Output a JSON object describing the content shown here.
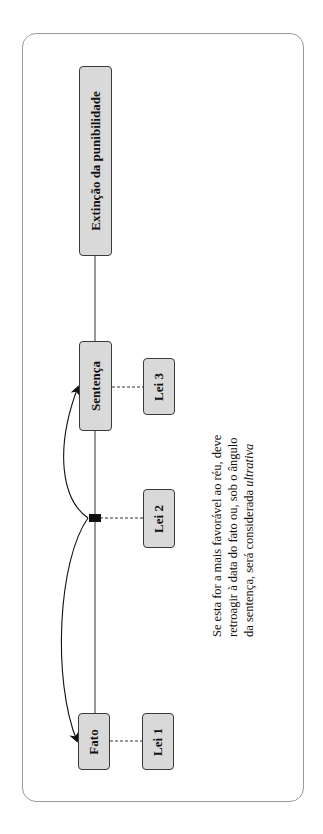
{
  "diagram": {
    "nodes": {
      "extincao": "Extinção da punibilidade",
      "sentenca": "Sentença",
      "fato": "Fato",
      "lei1": "Lei 1",
      "lei2": "Lei 2",
      "lei3": "Lei 3"
    },
    "note": {
      "text": "Se esta for a mais favorável ao réu, deve retroagir à data do fato ou, sob o ângulo da sentença, será considerada",
      "emphasis": "ultrativa"
    },
    "edges": [
      {
        "from": "Fato",
        "to": "Sentença",
        "style": "solid"
      },
      {
        "from": "Sentença",
        "to": "Extinção da punibilidade",
        "style": "solid"
      },
      {
        "from": "Fato",
        "to": "Lei 1",
        "style": "dashed"
      },
      {
        "from": "junction",
        "to": "Lei 2",
        "style": "dashed"
      },
      {
        "from": "Sentença",
        "to": "Lei 3",
        "style": "dashed"
      },
      {
        "from": "junction",
        "to": "Fato",
        "style": "curved-arrow"
      },
      {
        "from": "junction",
        "to": "Sentença",
        "style": "curved-arrow"
      }
    ],
    "colors": {
      "node_fill": "#d9d9d9",
      "node_border": "#3a3a3a",
      "frame_border": "#9a9a9a",
      "line": "#222222"
    }
  }
}
